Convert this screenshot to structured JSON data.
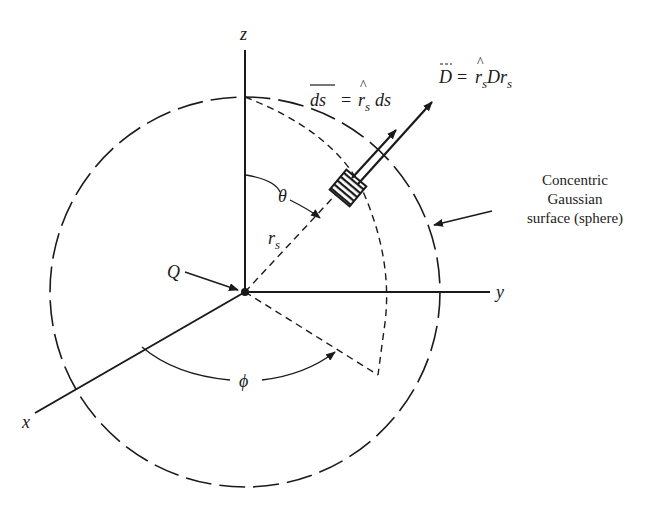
{
  "diagram": {
    "axes": {
      "z_label": "z",
      "y_label": "y",
      "x_label": "x"
    },
    "labels": {
      "charge": "Q",
      "theta": "θ",
      "phi": "ϕ",
      "radius_main": "r",
      "radius_sub": "s",
      "ds_lhs": "ds",
      "ds_eq": "=",
      "ds_rhat": "r",
      "ds_rhat_sub": "s",
      "ds_rhs": "ds",
      "D_lhs": "D",
      "D_eq": "=",
      "D_rhat": "r",
      "D_rhat_sub": "s",
      "D_mid": "D",
      "D_r": "r",
      "D_r_sub": "s"
    },
    "caption": {
      "line1": "Concentric",
      "line2": "Gaussian",
      "line3": "surface (sphere)"
    },
    "colors": {
      "ink": "#1a1a1a",
      "background": "#ffffff"
    }
  }
}
